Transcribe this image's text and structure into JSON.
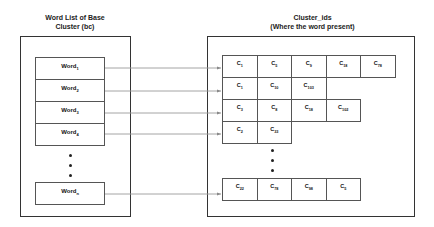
{
  "left_panel": {
    "title_line1": "Word List of Base",
    "title_line2": "Cluster (bc)",
    "words": [
      {
        "base": "Word",
        "sub": "1"
      },
      {
        "base": "Word",
        "sub": "2"
      },
      {
        "base": "Word",
        "sub": "3"
      },
      {
        "base": "Word",
        "sub": "4"
      }
    ],
    "ellipsis": "• • •",
    "last_word": {
      "base": "Word",
      "sub": "n"
    }
  },
  "right_panel": {
    "title_line1": "Cluster_ids",
    "title_line2": "(Where the word present)",
    "rows": [
      [
        {
          "base": "C",
          "sub": "1"
        },
        {
          "base": "C",
          "sub": "5"
        },
        {
          "base": "C",
          "sub": "9"
        },
        {
          "base": "C",
          "sub": "18"
        },
        {
          "base": "C",
          "sub": "78"
        }
      ],
      [
        {
          "base": "C",
          "sub": "1"
        },
        {
          "base": "C",
          "sub": "10"
        },
        {
          "base": "C",
          "sub": "103"
        }
      ],
      [
        {
          "base": "C",
          "sub": "3"
        },
        {
          "base": "C",
          "sub": "8"
        },
        {
          "base": "C",
          "sub": "18"
        },
        {
          "base": "C",
          "sub": "102"
        }
      ],
      [
        {
          "base": "C",
          "sub": "2"
        },
        {
          "base": "C",
          "sub": "33"
        }
      ]
    ],
    "ellipsis": "• • •",
    "last_row": [
      {
        "base": "C",
        "sub": "22"
      },
      {
        "base": "C",
        "sub": "78"
      },
      {
        "base": "C",
        "sub": "98"
      },
      {
        "base": "C",
        "sub": "5"
      }
    ]
  },
  "colors": {
    "border": "#333333",
    "arrow": "#999999",
    "background": "#ffffff"
  }
}
